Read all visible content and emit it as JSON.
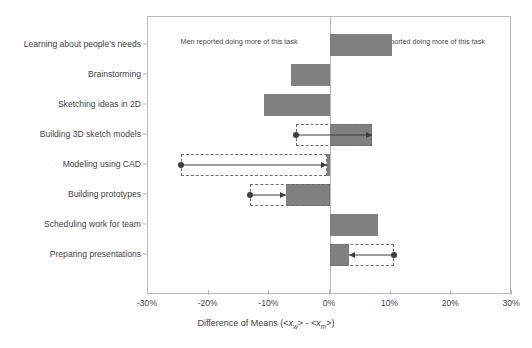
{
  "chart_data": {
    "type": "bar",
    "orientation": "horizontal",
    "title": "",
    "xlabel": "Difference of Means (<x_w> - <x_m>)",
    "ylabel": "",
    "xlim": [
      -30,
      30
    ],
    "xticks": [
      -30,
      -20,
      -10,
      0,
      10,
      20,
      30
    ],
    "xtick_labels": [
      "-30%",
      "-20%",
      "-10%",
      "0%",
      "10%",
      "20%",
      "30%"
    ],
    "grid": false,
    "legend": "none",
    "units": "percent",
    "categories": [
      "Learning about people's needs",
      "Brainstorming",
      "Sketching ideas in 2D",
      "Building 3D sketch models",
      "Modeling using CAD",
      "Building prototypes",
      "Scheduling work for team",
      "Preparing presentations"
    ],
    "values": [
      10.3,
      -6.5,
      -10.9,
      7.0,
      -0.5,
      -7.3,
      7.9,
      3.2
    ],
    "annotations": [
      {
        "category": "Building 3D sketch models",
        "from": -5.6,
        "to": 7.0,
        "direction": "right",
        "box_start": -5.6,
        "box_end": 7.0
      },
      {
        "category": "Modeling using CAD",
        "from": -24.6,
        "to": -0.5,
        "direction": "right",
        "box_start": -24.6,
        "box_end": -0.5
      },
      {
        "category": "Building prototypes",
        "from": -13.2,
        "to": -7.3,
        "direction": "right",
        "box_start": -13.2,
        "box_end": 0.0
      },
      {
        "category": "Preparing presentations",
        "from": 10.6,
        "to": 3.2,
        "direction": "left",
        "box_start": 0.0,
        "box_end": 10.6
      }
    ],
    "bar_color": "#808080",
    "annotation_color": "#3d3d3d",
    "frame_color": "#b9b9b9"
  },
  "headers": {
    "left": "Men reported doing more of this task",
    "right": "Women reported doing more of this task"
  },
  "axis": {
    "xlabel_prefix": "Difference of Means (<",
    "xlabel_x1": "x",
    "xlabel_sub1": "w",
    "xlabel_mid": "> - <",
    "xlabel_x2": "x",
    "xlabel_sub2": "m",
    "xlabel_suffix": ">)"
  }
}
